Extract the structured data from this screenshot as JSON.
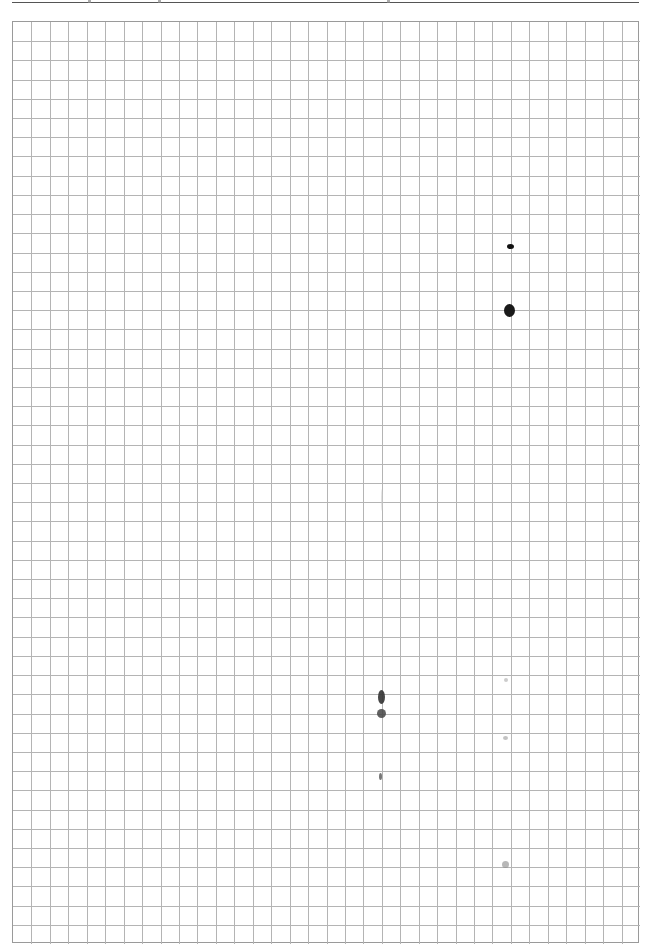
{
  "page": {
    "width": 650,
    "height": 950,
    "background": "#ffffff"
  },
  "header": {
    "rule_color": "#555555",
    "fragments_x": [
      88,
      158,
      387
    ]
  },
  "grid": {
    "left": 12,
    "top": 21,
    "width": 627,
    "height": 922,
    "columns": 34,
    "rows": 48,
    "line_color": "#b4b4b4",
    "border_color": "#9a9a9a"
  },
  "marks": [
    {
      "name": "ink-dot-small",
      "x": 510,
      "y": 246,
      "w": 7,
      "h": 5,
      "color": "#111111",
      "opacity": 1
    },
    {
      "name": "ink-dot-large",
      "x": 509,
      "y": 310,
      "w": 11,
      "h": 13,
      "color": "#1a1a1a",
      "opacity": 1
    },
    {
      "name": "ink-smudge-upper",
      "x": 381,
      "y": 697,
      "w": 7,
      "h": 14,
      "color": "#333333",
      "opacity": 0.9
    },
    {
      "name": "ink-smudge-lower",
      "x": 381,
      "y": 713,
      "w": 9,
      "h": 9,
      "color": "#444444",
      "opacity": 0.85
    },
    {
      "name": "ink-speck",
      "x": 380,
      "y": 776,
      "w": 3,
      "h": 7,
      "color": "#555555",
      "opacity": 0.8
    },
    {
      "name": "faint-speck-1",
      "x": 506,
      "y": 680,
      "w": 4,
      "h": 4,
      "color": "#aaaaaa",
      "opacity": 0.6
    },
    {
      "name": "faint-speck-2",
      "x": 505,
      "y": 738,
      "w": 5,
      "h": 4,
      "color": "#999999",
      "opacity": 0.6
    },
    {
      "name": "faint-speck-3",
      "x": 505,
      "y": 864,
      "w": 7,
      "h": 7,
      "color": "#888888",
      "opacity": 0.6
    },
    {
      "name": "faint-streak",
      "x": 382,
      "y": 500,
      "w": 2,
      "h": 22,
      "color": "#cccccc",
      "opacity": 0.6
    }
  ]
}
